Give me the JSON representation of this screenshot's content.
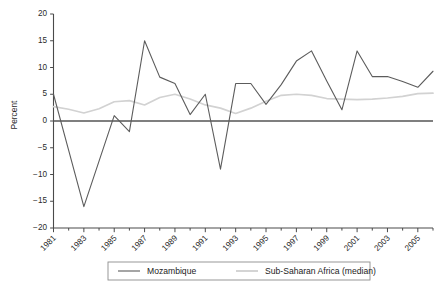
{
  "chart_data": {
    "type": "line",
    "title": "",
    "xlabel": "",
    "ylabel": "Percent",
    "ylim": [
      -20,
      20
    ],
    "xlim": [
      1981,
      2006
    ],
    "yticks": [
      20,
      15,
      10,
      5,
      0,
      -5,
      -10,
      -15,
      -20
    ],
    "ytick_labels": [
      "20",
      "15",
      "10",
      "5",
      "0",
      "−5",
      "−10",
      "−15",
      "−20"
    ],
    "xticks": [
      1981,
      1983,
      1985,
      1987,
      1989,
      1991,
      1993,
      1995,
      1997,
      1999,
      2001,
      2003,
      2005
    ],
    "xtick_labels": [
      "1981",
      "1983",
      "1985",
      "1987",
      "1989",
      "1991",
      "1993",
      "1995",
      "1997",
      "1999",
      "2001",
      "2003",
      "2005"
    ],
    "x": [
      1981,
      1982,
      1983,
      1984,
      1985,
      1986,
      1987,
      1988,
      1989,
      1990,
      1991,
      1992,
      1993,
      1994,
      1995,
      1996,
      1997,
      1998,
      1999,
      2000,
      2001,
      2002,
      2003,
      2004,
      2005,
      2006
    ],
    "grid": false,
    "legend_position": "bottom",
    "zero_line": true,
    "series": [
      {
        "name": "Mozambique",
        "color": "#5c5c5c",
        "values": [
          5.0,
          -5.5,
          -16.0,
          -7.5,
          1.0,
          -2.0,
          15.0,
          8.2,
          7.0,
          1.2,
          5.0,
          -9.0,
          7.0,
          7.0,
          3.1,
          6.8,
          11.2,
          13.1,
          7.5,
          2.1,
          13.1,
          8.3,
          8.3,
          7.4,
          6.3,
          9.3
        ]
      },
      {
        "name": "Sub-Saharan Africa (median)",
        "color": "#d2d2d2",
        "values": [
          2.7,
          2.2,
          1.5,
          2.3,
          3.6,
          3.8,
          3.0,
          4.4,
          5.0,
          4.1,
          3.0,
          2.4,
          1.4,
          2.4,
          3.7,
          4.8,
          5.0,
          4.8,
          4.2,
          4.1,
          4.0,
          4.1,
          4.3,
          4.6,
          5.1,
          5.2
        ]
      }
    ]
  },
  "legend": {
    "items": [
      {
        "label": "Mozambique",
        "color": "#5c5c5c"
      },
      {
        "label": "Sub-Saharan Africa (median)",
        "color": "#d2d2d2"
      }
    ]
  },
  "axes": {
    "y_title": "Percent"
  }
}
